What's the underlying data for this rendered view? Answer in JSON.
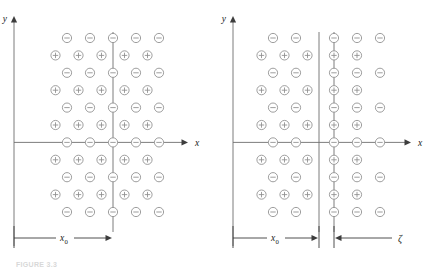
{
  "figure": {
    "caption": "FIGURE 3.3",
    "type": "ionic-lattice-displacement-diagram"
  },
  "panels": [
    {
      "id": "left",
      "name": "undisplaced-lattice",
      "axes": {
        "x_label": "x",
        "y_label": "y",
        "x_axis_name": "x-axis",
        "y_axis_name": "y-axis",
        "arrowheads": true
      },
      "dimension": {
        "label": "x_0",
        "label_base": "x",
        "label_sub": "0",
        "style": "single-arrow-right"
      },
      "lattice": {
        "rows": 11,
        "start_sign": "minus",
        "minus_row_count": 6,
        "plus_row_count": 5,
        "minus_cols": 5,
        "plus_cols": 5,
        "minus_symbol": "−",
        "plus_symbol": "+",
        "offset_description": "plus rows shifted left by half spacing"
      }
    },
    {
      "id": "right",
      "name": "displaced-lattice",
      "axes": {
        "x_label": "x",
        "y_label": "y",
        "x_axis_name": "x-axis",
        "y_axis_name": "y-axis",
        "arrowheads": true
      },
      "dimension": {
        "label": "x_0",
        "label_base": "x",
        "label_sub": "0",
        "style": "single-arrow-right"
      },
      "dimension_gap": {
        "label": "ζ",
        "name": "zeta",
        "style": "arrow-left-from-label"
      },
      "lattice": {
        "rows": 11,
        "start_sign": "minus",
        "minus_symbol": "−",
        "plus_symbol": "+",
        "left_block_minus_cols": 2,
        "left_block_plus_cols": 3,
        "right_block_minus_cols": 3,
        "right_block_plus_cols": 2,
        "boundary_lines": 2,
        "gap_description": "right block displaced to the right by zeta creating a gap at the boundary"
      }
    }
  ],
  "colors": {
    "ion_stroke": "#8c8c8c",
    "ion_fill": "#ffffff",
    "axis": "#6e6e6e",
    "dimension_line": "#3d3d3d",
    "label_text": "#1a1a1a",
    "background": "#ffffff",
    "caption_text": "#d8d8d8"
  },
  "geometry": {
    "ion_radius_px": 4.6,
    "col_spacing_px": 23,
    "row_spacing_px": 17.4,
    "panel_width_px": 219,
    "panel_height_px": 266
  }
}
